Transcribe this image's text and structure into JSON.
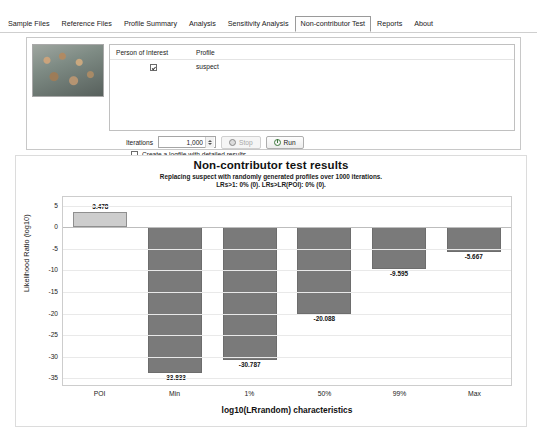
{
  "tabs": [
    {
      "label": "Sample Files",
      "active": false
    },
    {
      "label": "Reference Files",
      "active": false
    },
    {
      "label": "Profile Summary",
      "active": false
    },
    {
      "label": "Analysis",
      "active": false
    },
    {
      "label": "Sensitivity Analysis",
      "active": false
    },
    {
      "label": "Non-contributor Test",
      "active": true
    },
    {
      "label": "Reports",
      "active": false
    },
    {
      "label": "About",
      "active": false
    }
  ],
  "panel": {
    "grid": {
      "headers": [
        "Person of Interest",
        "Profile"
      ],
      "rows": [
        {
          "checked": true,
          "profile": "suspect"
        }
      ]
    },
    "iterations_label": "Iterations",
    "iterations_value": "1,000",
    "stop_button": "Stop",
    "run_button": "Run",
    "logfile_checkbox_label": "Create a logfile with detailed results",
    "logfile_checked": false
  },
  "chart_data": {
    "type": "bar",
    "title": "Non-contributor test results",
    "subtitle": "Replacing suspect with randomly generated profiles over 1000 iterations.",
    "subtitle2": "LRs>1: 0% (0).    LRs>LR(POI): 0% (0).",
    "xlabel": "log10(LRrandom) characteristics",
    "ylabel": "Likelihood Ratio (log10)",
    "categories": [
      "POI",
      "Min",
      "1%",
      "50%",
      "99%",
      "Max"
    ],
    "values": [
      3.478,
      -33.833,
      -30.787,
      -20.088,
      -9.595,
      -5.667
    ],
    "value_labels": [
      "3.478",
      "-33.833",
      "-30.787",
      "-20.088",
      "-9.595",
      "-5.667"
    ],
    "yticks": [
      5,
      0,
      -5,
      -10,
      -15,
      -20,
      -25,
      -30,
      -35
    ],
    "ytick_labels": [
      "5",
      "0",
      "-5",
      "-10",
      "-15",
      "-20",
      "-25",
      "-30",
      "-35"
    ],
    "ylim": [
      -37,
      7
    ],
    "grid": true,
    "legend": "none",
    "colors": {
      "poi_bar": "#cdcdcd",
      "random_bar": "#7a7a7a"
    }
  }
}
